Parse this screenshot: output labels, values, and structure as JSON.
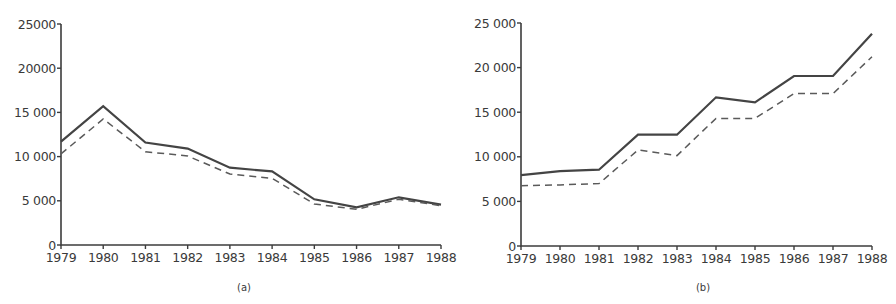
{
  "chart_data": [
    {
      "type": "line",
      "title": "",
      "caption": "(a)",
      "xlabel": "",
      "ylabel": "",
      "x": [
        1979,
        1980,
        1981,
        1982,
        1983,
        1984,
        1985,
        1986,
        1987,
        1988
      ],
      "x_tick_labels": [
        "1979",
        "1980",
        "1981",
        "1982",
        "1983",
        "1984",
        "1985",
        "1986",
        "1987",
        "1988"
      ],
      "y_ticks": [
        0,
        5000,
        10000,
        15000,
        20000,
        25000
      ],
      "y_tick_labels": [
        "0",
        "5 000",
        "10 000",
        "15 000",
        "20000",
        "25000"
      ],
      "ylim": [
        0,
        25000
      ],
      "grid": false,
      "legend": null,
      "series": [
        {
          "name": "solid",
          "style": "solid",
          "values": [
            11700,
            15700,
            11600,
            10900,
            8750,
            8330,
            5170,
            4260,
            5400,
            4560
          ]
        },
        {
          "name": "dashed",
          "style": "dashed",
          "values": [
            10300,
            14250,
            10550,
            10070,
            8030,
            7540,
            4640,
            4040,
            5170,
            4450
          ]
        }
      ]
    },
    {
      "type": "line",
      "title": "",
      "caption": "(b)",
      "xlabel": "",
      "ylabel": "",
      "x": [
        1979,
        1980,
        1981,
        1982,
        1983,
        1984,
        1985,
        1986,
        1987,
        1988
      ],
      "x_tick_labels": [
        "1979",
        "1980",
        "1981",
        "1982",
        "1983",
        "1984",
        "1985",
        "1986",
        "1987",
        "1988"
      ],
      "y_ticks": [
        0,
        5000,
        10000,
        15000,
        20000,
        25000
      ],
      "y_tick_labels": [
        "0",
        "5 000",
        "10 000",
        "15 000",
        "20 000",
        "25 000"
      ],
      "ylim": [
        0,
        25000
      ],
      "grid": false,
      "legend": null,
      "series": [
        {
          "name": "solid",
          "style": "solid",
          "values": [
            7950,
            8400,
            8550,
            12480,
            12480,
            16670,
            16110,
            19060,
            19060,
            23800
          ]
        },
        {
          "name": "dashed",
          "style": "dashed",
          "values": [
            6760,
            6850,
            6990,
            10760,
            10130,
            14310,
            14310,
            17080,
            17080,
            21220
          ]
        }
      ]
    }
  ]
}
